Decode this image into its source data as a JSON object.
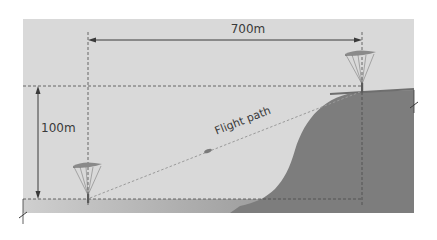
{
  "diagram": {
    "type": "paragliding-glide-diagram",
    "labels": {
      "horizontal_distance": "700m",
      "vertical_height": "100m",
      "path": "Flight path"
    },
    "colors": {
      "sky": "#d9d9d9",
      "ground_light": "#c8c8c8",
      "hill": "#7d7d7d",
      "lines": "#4a4a4a",
      "text": "#3a3a3a",
      "canopy": "#8a8a8a",
      "flight_path": "#9a9a9a"
    },
    "elements": [
      {
        "name": "launch-glider",
        "position": "top of hill (right)"
      },
      {
        "name": "landing-glider",
        "position": "landing field (left)"
      },
      {
        "name": "in-flight-glider",
        "position": "midway along flight path"
      }
    ]
  }
}
